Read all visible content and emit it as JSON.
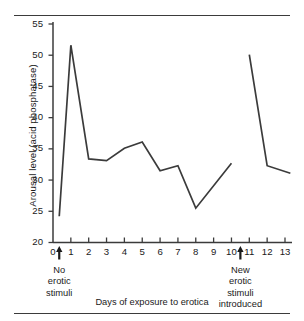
{
  "chart_data": {
    "type": "line",
    "title": "",
    "xlabel": "Days of exposure to erotica",
    "ylabel": "Arousal level (acid phosphatase)",
    "xlim": [
      0,
      13.4
    ],
    "ylim": [
      20,
      55
    ],
    "yticks": [
      20,
      25,
      30,
      35,
      40,
      45,
      50,
      55
    ],
    "xticks": [
      0,
      1,
      2,
      3,
      4,
      5,
      6,
      7,
      8,
      9,
      10,
      11,
      12,
      13
    ],
    "grid": false,
    "legend": null,
    "line_color": "#3b3b3b",
    "series": [
      {
        "name": "Arousal level segment 1",
        "x": [
          0.35,
          1.0,
          2.0,
          3.0,
          4.0,
          5.0,
          6.0,
          7.0,
          8.0,
          10.0
        ],
        "values": [
          24.2,
          51.6,
          33.4,
          33.1,
          35.1,
          36.1,
          31.5,
          32.3,
          25.5,
          32.7
        ]
      },
      {
        "name": "Arousal level segment 2",
        "x": [
          11.0,
          12.0,
          13.3
        ],
        "values": [
          50.1,
          32.3,
          31.1
        ]
      }
    ],
    "annotations": [
      {
        "name": "no-erotic-stimuli",
        "x": 0.35,
        "marker": "up-arrow",
        "lines": [
          "No",
          "erotic",
          "stimuli"
        ]
      },
      {
        "name": "new-erotic-stimuli-introduced",
        "x": 10.5,
        "marker": "up-arrow",
        "lines": [
          "New",
          "erotic",
          "stimuli",
          "introduced"
        ]
      }
    ]
  },
  "axes": {
    "y_label": "Arousal level (acid phosphatase)",
    "x_label": "Days of exposure to erotica",
    "y_tick_labels": [
      "55",
      "50",
      "45",
      "40",
      "35",
      "30",
      "25",
      "20"
    ],
    "x_tick_labels": [
      "0",
      "1",
      "2",
      "3",
      "4",
      "5",
      "6",
      "7",
      "8",
      "9",
      "10",
      "11",
      "12",
      "13"
    ]
  },
  "annotation_left": {
    "line1": "No",
    "line2": "erotic",
    "line3": "stimuli"
  },
  "annotation_right": {
    "line1": "New",
    "line2": "erotic",
    "line3": "stimuli",
    "line4": "introduced"
  }
}
